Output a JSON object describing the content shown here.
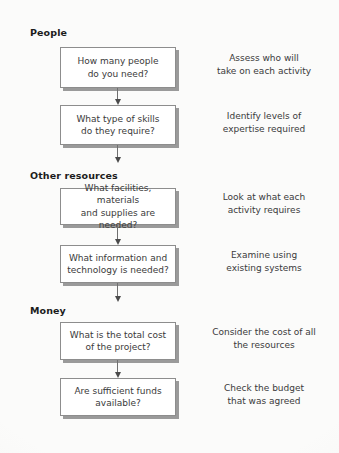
{
  "diagram": {
    "background_color": "#fbfbfa",
    "node_fill": "#ffffff",
    "node_border_color": "#8d8d8d",
    "node_shadow_color": "#9a9a9a",
    "text_color": "#3a3a3a",
    "heading_color": "#1c1c1c",
    "arrow_color": "#4a4a4a"
  },
  "sections": [
    {
      "heading": "People"
    },
    {
      "heading": "Other resources"
    },
    {
      "heading": "Money"
    }
  ],
  "nodes": [
    {
      "label": "How many people\ndo you need?"
    },
    {
      "label": "What type of skills\ndo they require?"
    },
    {
      "label": "What facilities, materials\nand supplies are needed?"
    },
    {
      "label": "What information and\ntechnology is needed?"
    },
    {
      "label": "What is the total cost\nof the project?"
    },
    {
      "label": "Are sufficient funds\navailable?"
    }
  ],
  "notes": [
    {
      "text": "Assess who will\ntake on each activity"
    },
    {
      "text": "Identify levels of\nexpertise required"
    },
    {
      "text": "Look at what each\nactivity requires"
    },
    {
      "text": "Examine using\nexisting systems"
    },
    {
      "text": "Consider the cost of all\nthe resources"
    },
    {
      "text": "Check the budget\nthat was agreed"
    }
  ],
  "connectors": [
    {
      "name": "arrow-node1-to-node2"
    },
    {
      "name": "arrow-node2-to-node3"
    },
    {
      "name": "arrow-node3-to-node4"
    },
    {
      "name": "arrow-node4-to-node5"
    },
    {
      "name": "arrow-node5-to-node6"
    }
  ]
}
